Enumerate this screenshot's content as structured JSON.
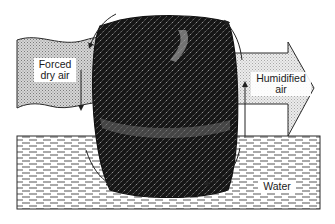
{
  "diagram": {
    "labels": {
      "inlet_line1": "Forced",
      "inlet_line2": "dry air",
      "outlet_line1": "Humidified",
      "outlet_line2": "air",
      "water": "Water"
    },
    "components": [
      {
        "id": "inlet-airflow",
        "label": "Forced dry air",
        "shape": "wavy band",
        "fill": "#bdbdbd"
      },
      {
        "id": "drum",
        "label": "Rotating mesh drum",
        "shape": "barrel",
        "fill": "#1c1c1c"
      },
      {
        "id": "outlet-airflow",
        "label": "Humidified air",
        "shape": "block arrow",
        "fill": "#d9d9d9"
      },
      {
        "id": "water-reservoir",
        "label": "Water",
        "shape": "rectangle with dashed fill",
        "fill": "#ffffff"
      }
    ],
    "rotation_arrows": [
      {
        "position": "top-left",
        "direction": "clockwise"
      },
      {
        "position": "top-right",
        "direction": "clockwise"
      },
      {
        "position": "bottom-left",
        "direction": "clockwise"
      },
      {
        "position": "bottom-right",
        "direction": "clockwise"
      },
      {
        "position": "left-vertical",
        "direction": "down"
      },
      {
        "position": "right-vertical",
        "direction": "up"
      }
    ],
    "colors": {
      "line": "#2a2a2a",
      "drum_dark": "#151515",
      "drum_light": "#8a8a8a",
      "inlet_fill": "#bdbdbd",
      "outlet_fill": "#dcdcdc",
      "water_dash": "#555555"
    }
  }
}
